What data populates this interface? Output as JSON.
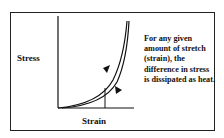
{
  "diagram": {
    "type": "stress-strain hysteresis",
    "axes": {
      "ylabel": "Stress",
      "xlabel": "Strain"
    },
    "curves": [
      {
        "name": "loading-curve",
        "direction": "up"
      },
      {
        "name": "unloading-curve",
        "direction": "down"
      }
    ],
    "annotation": "For any given amount of stretch (strain), the difference in stress is dissipated as heat.",
    "colors": {
      "line": "#111111",
      "background": "#ffffff",
      "border": "#222222"
    }
  }
}
